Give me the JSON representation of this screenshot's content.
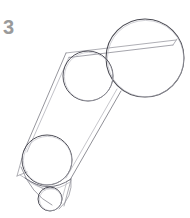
{
  "canvas": {
    "width": 190,
    "height": 218,
    "background_color": "#ffffff"
  },
  "label": {
    "step_number": "3",
    "color": "#9a9a9a"
  },
  "stroke": {
    "primary_color": "#4a4a52",
    "secondary_color": "#8d8d95",
    "faint_color": "#a8a8b0",
    "width_main": 1.0,
    "width_light": 0.8
  },
  "drawing": {
    "title": "Tutorial step 3 construction sketch",
    "type": "pencil-sketch",
    "shapes": [
      {
        "name": "large-circle-top-right",
        "kind": "circle",
        "cx": 145,
        "cy": 58,
        "r": 39
      },
      {
        "name": "medium-circle-center",
        "kind": "circle",
        "cx": 88,
        "cy": 76,
        "r": 25
      },
      {
        "name": "medium-circle-lower-left",
        "kind": "circle",
        "cx": 47,
        "cy": 160,
        "r": 25
      },
      {
        "name": "small-circle-bottom",
        "kind": "circle",
        "cx": 50,
        "cy": 199,
        "r": 12
      }
    ],
    "connectors": [
      {
        "name": "tangent-top-upper",
        "kind": "line",
        "x1": 66,
        "y1": 53,
        "x2": 176,
        "y2": 40
      },
      {
        "name": "tangent-top-lower",
        "kind": "line",
        "x1": 69,
        "y1": 57,
        "x2": 172,
        "y2": 44
      },
      {
        "name": "tangent-left-long",
        "kind": "line",
        "x1": 66,
        "y1": 53,
        "x2": 24,
        "y2": 151
      },
      {
        "name": "tangent-right-long",
        "kind": "line",
        "x1": 121,
        "y1": 91,
        "x2": 70,
        "y2": 180
      },
      {
        "name": "tangent-left-spur",
        "kind": "line",
        "x1": 21,
        "y1": 160,
        "x2": 17,
        "y2": 177
      },
      {
        "name": "tangent-bottom-left",
        "kind": "line",
        "x1": 20,
        "y1": 175,
        "x2": 44,
        "y2": 189
      },
      {
        "name": "tangent-bottom-right",
        "kind": "line",
        "x1": 70,
        "y1": 180,
        "x2": 63,
        "y2": 205
      }
    ],
    "arcs": [
      {
        "name": "jaw-arc-left",
        "kind": "arc",
        "d": "M 21,168 Q 34,196 55,204"
      },
      {
        "name": "jaw-arc-right",
        "kind": "arc",
        "d": "M 71,179 Q 72,198 58,209"
      },
      {
        "name": "chin-arc",
        "kind": "arc",
        "d": "M 25,179 Q 49,194 72,180"
      }
    ]
  }
}
